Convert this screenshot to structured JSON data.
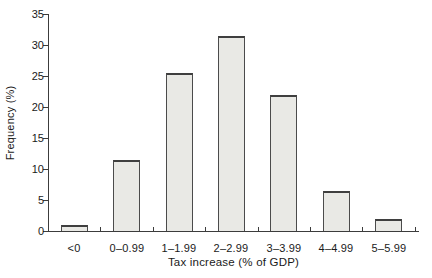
{
  "chart_data": {
    "type": "bar",
    "title": "",
    "xlabel": "Tax increase (% of GDP)",
    "ylabel": "Frequency (%)",
    "categories": [
      "<0",
      "0–0.99",
      "1–1.99",
      "2–2.99",
      "3–3.99",
      "4–4.99",
      "5–5.99"
    ],
    "values": [
      1,
      11.5,
      25.5,
      31.5,
      22,
      6.5,
      2
    ],
    "ylim": [
      0,
      35
    ],
    "yticks": [
      0,
      5,
      10,
      15,
      20,
      25,
      30,
      35
    ],
    "grid": false,
    "legend": null,
    "bar_fill": "#e9e9e5",
    "bar_border": "#4b4b4b",
    "bar_border_top": "#3f3f3f",
    "axis_color": "#3c3c3c",
    "text_color": "#1a1a1a"
  }
}
